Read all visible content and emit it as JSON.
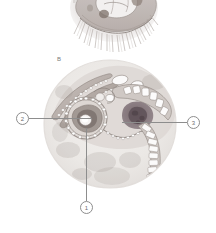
{
  "figure": {
    "background_color": "#ffffff",
    "panels": [
      {
        "id": "panel-a",
        "label": "",
        "type": "histology-micrograph",
        "description": "cropped partial micrograph with radiating ciliary hair-like projections along the lower margin"
      },
      {
        "id": "panel-b",
        "label": "B",
        "type": "histology-micrograph",
        "description": "circular microscopy field showing a sectioned embryonic structure with a central ring, banded epithelial layers and a segmented tail-like band"
      }
    ]
  },
  "callouts": [
    {
      "id": "callout-1",
      "number": "1",
      "position": "bottom",
      "leader": "vertical"
    },
    {
      "id": "callout-2",
      "number": "2",
      "position": "left",
      "leader": "horizontal"
    },
    {
      "id": "callout-3",
      "number": "3",
      "position": "right",
      "leader": "horizontal"
    }
  ],
  "colors": {
    "line": "#8d8d8d",
    "text": "#6f6f6f",
    "tissue_pale": "#e6e2e0",
    "tissue_mid": "#b9b2ad",
    "tissue_dark": "#6d6460",
    "tissue_accent": "#8e7f86",
    "field_bg": "#efedeb"
  }
}
